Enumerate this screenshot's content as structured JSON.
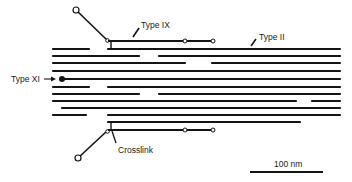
{
  "colors": {
    "ink": "#141414",
    "background": "#ffffff"
  },
  "labels": {
    "type_ix": "Type IX",
    "type_ii": "Type II",
    "type_xi": "Type XI",
    "crosslink": "Crosslink",
    "scale": "100 nm"
  },
  "fibrils": [
    {
      "y": 49,
      "segments": [
        [
          53,
          89
        ],
        [
          108,
          340
        ]
      ]
    },
    {
      "y": 56,
      "segments": [
        [
          53,
          139
        ],
        [
          159,
          340
        ]
      ]
    },
    {
      "y": 63,
      "segments": [
        [
          53,
          185
        ],
        [
          212,
          340
        ]
      ]
    },
    {
      "y": 71,
      "segments": [
        [
          53,
          340
        ]
      ]
    },
    {
      "y": 79,
      "segments": [
        [
          63,
          340
        ]
      ],
      "type_xi": true
    },
    {
      "y": 87,
      "segments": [
        [
          53,
          89
        ],
        [
          108,
          340
        ]
      ]
    },
    {
      "y": 94,
      "segments": [
        [
          53,
          139
        ],
        [
          159,
          340
        ]
      ]
    },
    {
      "y": 101,
      "segments": [
        [
          53,
          296
        ],
        [
          312,
          340
        ]
      ]
    },
    {
      "y": 108,
      "segments": [
        [
          62,
          340
        ]
      ]
    },
    {
      "y": 115,
      "segments": [
        [
          53,
          86
        ],
        [
          108,
          340
        ]
      ]
    },
    {
      "y": 122,
      "segments": [
        [
          108,
          300
        ]
      ]
    }
  ],
  "type_ix_top": {
    "arm": {
      "x1": 76,
      "y1": 10,
      "x2": 107,
      "y2": 40
    },
    "shaft": {
      "x1": 108,
      "y1": 41,
      "x2": 213,
      "y2": 41
    },
    "nodes": [
      [
        185,
        41
      ],
      [
        213,
        41
      ]
    ],
    "crosslink": {
      "x": 111,
      "y1": 41,
      "y2": 49
    }
  },
  "type_ix_bottom": {
    "arm": {
      "x1": 78,
      "y1": 158,
      "x2": 107,
      "y2": 131
    },
    "shaft": {
      "x1": 108,
      "y1": 130,
      "x2": 213,
      "y2": 130
    },
    "nodes": [
      [
        185,
        130
      ],
      [
        213,
        130
      ]
    ],
    "crosslink": {
      "x": 111,
      "y1": 122,
      "y2": 130
    }
  },
  "scale_bar": {
    "x1": 250,
    "x2": 323,
    "y": 172,
    "label_x": 274,
    "label_y": 167
  }
}
